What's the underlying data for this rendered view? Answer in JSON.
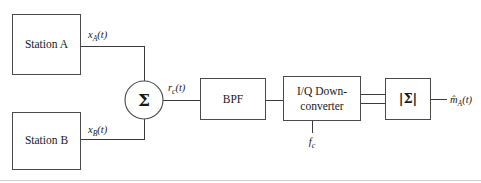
{
  "figure": {
    "type": "block-diagram",
    "background_color": "#ffffff",
    "line_color": "#4a4a4a",
    "text_color": "#1a1a1a"
  },
  "blocks": {
    "station_a": {
      "label": "Station A"
    },
    "station_b": {
      "label": "Station B"
    },
    "summer": {
      "label": "Σ"
    },
    "bpf": {
      "label": "BPF"
    },
    "downconverter": {
      "line1": "I/Q Down-",
      "line2": "converter"
    },
    "magnitude": {
      "label": "|Σ|"
    }
  },
  "signals": {
    "x_a": {
      "base": "x",
      "sub": "A",
      "arg": "(t)"
    },
    "x_b": {
      "base": "x",
      "sub": "B",
      "arg": "(t)"
    },
    "r_c": {
      "base": "r",
      "sub": "c",
      "arg": "(t)"
    },
    "f_c": {
      "base": "f",
      "sub": "c",
      "arg": ""
    },
    "m_hat_a": {
      "base": "m̂",
      "sub": "A",
      "arg": "(t)"
    }
  }
}
